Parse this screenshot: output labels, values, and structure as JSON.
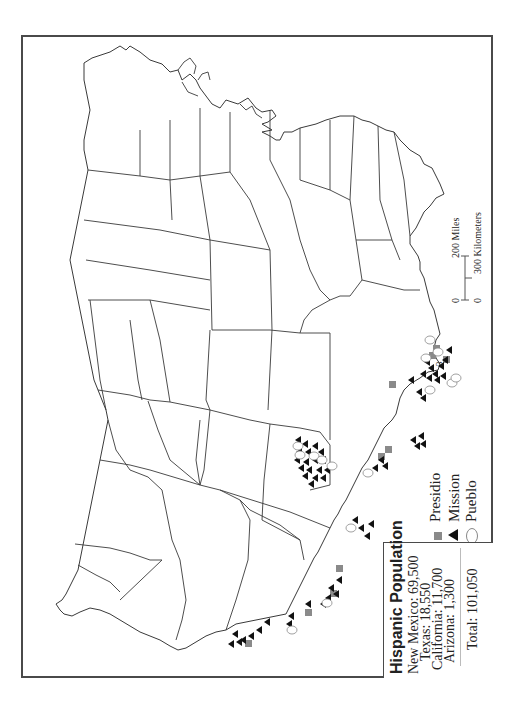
{
  "map": {
    "orientation": "rotated 90 degrees counter-clockwise (north to the left)",
    "region": "United States (lower 48)",
    "colors": {
      "presidio": "#8a8a8a",
      "mission": "#111111",
      "pueblo": "#ffffff",
      "outline": "#3a3a3a"
    }
  },
  "legend": {
    "title": "Hispanic Population",
    "rows": [
      {
        "label": "New Mexico:",
        "value": "69,500"
      },
      {
        "label": "Texas:",
        "value": "18,550"
      },
      {
        "label": "California:",
        "value": "11,700"
      },
      {
        "label": "Arizona:",
        "value": "1,300"
      }
    ],
    "total_label": "Total: 101,050"
  },
  "symbols": [
    {
      "name": "presidio",
      "label": "Presidio",
      "icon": "gray-square"
    },
    {
      "name": "mission",
      "label": "Mission",
      "icon": "black-triangle"
    },
    {
      "name": "pueblo",
      "label": "Pueblo",
      "icon": "open-circle"
    }
  ],
  "scale_bar": {
    "miles_zero": "0",
    "miles_label": "200 Miles",
    "km_zero": "0",
    "km_label": "300 Kilometers"
  },
  "annotations": {
    "florida_marker_label": "3"
  }
}
